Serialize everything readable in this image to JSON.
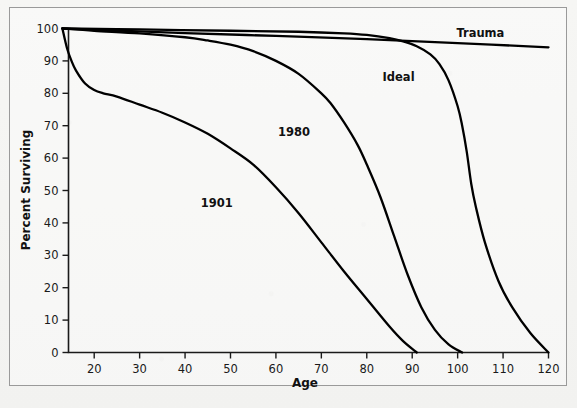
{
  "figure": {
    "background_color": "#f4f4f2",
    "border_color": "#9a9a9a",
    "curve_color": "#000000"
  },
  "chart_data": {
    "type": "line",
    "title": "",
    "xlabel": "Age",
    "ylabel": "Percent Surviving",
    "xlim": [
      13,
      120
    ],
    "ylim": [
      0,
      100
    ],
    "xticks": [
      20,
      30,
      40,
      50,
      60,
      70,
      80,
      90,
      100,
      110,
      120
    ],
    "yticks": [
      0,
      10,
      20,
      30,
      40,
      50,
      60,
      70,
      80,
      90,
      100
    ],
    "grid": false,
    "legend_position": "inline-annotations",
    "series": [
      {
        "name": "1901",
        "label": "1901",
        "label_x": 47,
        "label_y": 46,
        "x": [
          13,
          14,
          15,
          16,
          18,
          20,
          22,
          25,
          30,
          35,
          40,
          45,
          50,
          55,
          60,
          65,
          70,
          75,
          80,
          85,
          88,
          91
        ],
        "values": [
          100,
          94,
          90,
          87,
          83,
          81,
          80,
          79,
          76.5,
          74,
          71,
          67.5,
          63,
          58,
          51,
          43,
          34,
          25,
          16.5,
          8,
          3.5,
          0
        ]
      },
      {
        "name": "1980",
        "label": "1980",
        "label_x": 64,
        "label_y": 68,
        "x": [
          13,
          20,
          30,
          40,
          45,
          50,
          55,
          60,
          65,
          70,
          72,
          75,
          78,
          80,
          83,
          86,
          89,
          92,
          95,
          98,
          101
        ],
        "values": [
          100,
          99.3,
          98.5,
          97.3,
          96.3,
          95,
          93,
          90,
          86,
          80,
          77,
          71,
          64,
          58,
          48,
          36,
          24,
          14,
          7,
          2.5,
          0
        ]
      },
      {
        "name": "Ideal",
        "label": "Ideal",
        "label_x": 87,
        "label_y": 85,
        "x": [
          13,
          30,
          50,
          65,
          75,
          80,
          85,
          88,
          91,
          94,
          96,
          98,
          100,
          101,
          102,
          103,
          104,
          106,
          109,
          112,
          116,
          120
        ],
        "values": [
          100,
          99.7,
          99.3,
          99,
          98.5,
          98,
          97,
          96,
          94.5,
          92,
          89,
          84,
          76,
          70,
          62,
          52,
          45,
          34,
          22,
          14,
          6,
          0
        ]
      },
      {
        "name": "Trauma",
        "label": "Trauma",
        "label_x": 105,
        "label_y": 98.5,
        "x": [
          13,
          40,
          60,
          80,
          100,
          120
        ],
        "values": [
          100,
          98.6,
          97.7,
          96.7,
          95.5,
          94.2
        ]
      }
    ]
  },
  "axis": {
    "x_title": "Age",
    "y_title": "Percent Surviving",
    "x_tick_labels": [
      "20",
      "30",
      "40",
      "50",
      "60",
      "70",
      "80",
      "90",
      "100",
      "110",
      "120"
    ],
    "y_tick_labels": [
      "0",
      "10",
      "20",
      "30",
      "40",
      "50",
      "60",
      "70",
      "80",
      "90",
      "100"
    ]
  }
}
